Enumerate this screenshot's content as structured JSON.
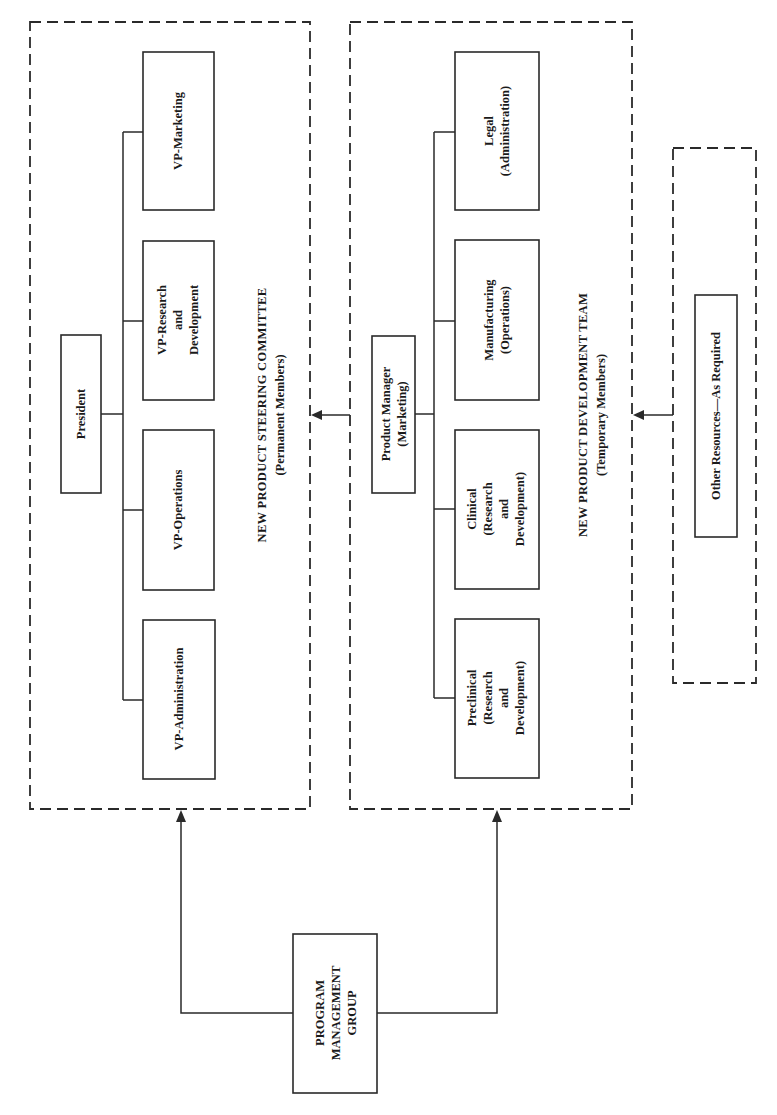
{
  "diagram": {
    "orientation": "rotated -90 degrees (text reads bottom-to-top)",
    "steering_committee": {
      "title": "NEW PRODUCT STEERING COMMITTEE",
      "subtitle": "(Permanent Members)",
      "head": "President",
      "members": [
        {
          "lines": [
            "VP-Marketing"
          ]
        },
        {
          "lines": [
            "VP-Research",
            "and",
            "Development"
          ]
        },
        {
          "lines": [
            "VP-Operations"
          ]
        },
        {
          "lines": [
            "VP-Administration"
          ]
        }
      ]
    },
    "development_team": {
      "title": "NEW PRODUCT DEVELOPMENT TEAM",
      "subtitle": "(Temporary Members)",
      "head": {
        "line1": "Product Manager",
        "line2": "(Marketing)"
      },
      "members": [
        {
          "lines": [
            "Legal",
            "(Administration)"
          ]
        },
        {
          "lines": [
            "Manufacturing",
            "(Operations)"
          ]
        },
        {
          "lines": [
            "Clinical",
            "(Research",
            "and",
            "Development)"
          ]
        },
        {
          "lines": [
            "Preclinical",
            "(Research",
            "and",
            "Development)"
          ]
        }
      ]
    },
    "other_resources": {
      "label": "Other Resources—As Required"
    },
    "program_management_group": {
      "lines": [
        "PROGRAM",
        "MANAGEMENT",
        "GROUP"
      ]
    }
  }
}
